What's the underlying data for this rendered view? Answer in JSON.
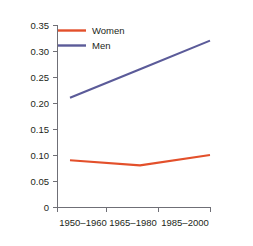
{
  "chart_data": {
    "type": "line",
    "title": "",
    "subtitle": "",
    "xlabel": "",
    "ylabel": "",
    "categories": [
      "1950–1960",
      "1965–1980",
      "1985–2000"
    ],
    "series": [
      {
        "name": "Women",
        "color": "#E3502B",
        "values": [
          0.09,
          0.08,
          0.1
        ]
      },
      {
        "name": "Men",
        "color": "#5B5B99",
        "values": [
          0.21,
          0.265,
          0.32
        ]
      }
    ],
    "ylim": [
      0,
      0.35
    ],
    "yticks": [
      0,
      0.05,
      0.1,
      0.15,
      0.2,
      0.25,
      0.3,
      0.35
    ],
    "ytick_labels": [
      "0",
      "0.05",
      "0.10",
      "0.15",
      "0.20",
      "0.25",
      "0.30",
      "0.35"
    ],
    "xtick_labels": [
      "1950–1960",
      "1965–1980",
      "1985–2000"
    ],
    "grid": false,
    "legend_position": "top-left-inside",
    "legend_entries": [
      "Women",
      "Men"
    ]
  },
  "axes": {
    "y_ticks": [
      {
        "label": "0.35",
        "value": 0.35
      },
      {
        "label": "0.30",
        "value": 0.3
      },
      {
        "label": "0.25",
        "value": 0.25
      },
      {
        "label": "0.20",
        "value": 0.2
      },
      {
        "label": "0.15",
        "value": 0.15
      },
      {
        "label": "0.10",
        "value": 0.1
      },
      {
        "label": "0.05",
        "value": 0.05
      },
      {
        "label": "0",
        "value": 0
      }
    ],
    "x_ticks": [
      {
        "label": "1950–1960"
      },
      {
        "label": "1965–1980"
      },
      {
        "label": "1985–2000"
      }
    ]
  },
  "legend": {
    "items": [
      {
        "label": "Women",
        "color": "#E3502B"
      },
      {
        "label": "Men",
        "color": "#5B5B99"
      }
    ]
  },
  "colors": {
    "women": "#E3502B",
    "men": "#5B5B99",
    "axis": "#6f6f76",
    "text": "#231f20",
    "background": "#ffffff"
  }
}
